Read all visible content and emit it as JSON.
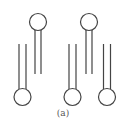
{
  "figure": {
    "caption": "(a)",
    "stroke_color": "#444444",
    "molecules": [
      {
        "name": "top-left-lipid",
        "head": {
          "cx": 38,
          "cy": 22,
          "r": 8.5
        },
        "tails": [
          {
            "x": 35,
            "y1": 30,
            "y2": 74
          },
          {
            "x": 41,
            "y1": 30,
            "y2": 74
          }
        ]
      },
      {
        "name": "top-right-lipid",
        "head": {
          "cx": 89,
          "cy": 22,
          "r": 8.5
        },
        "tails": [
          {
            "x": 86,
            "y1": 30,
            "y2": 74
          },
          {
            "x": 92,
            "y1": 30,
            "y2": 74
          }
        ]
      },
      {
        "name": "bottom-left-lipid",
        "head": {
          "cx": 22.5,
          "cy": 97,
          "r": 8.5
        },
        "tails": [
          {
            "x": 19,
            "y1": 44,
            "y2": 89
          },
          {
            "x": 26,
            "y1": 44,
            "y2": 89
          }
        ]
      },
      {
        "name": "bottom-middle-lipid",
        "head": {
          "cx": 72.5,
          "cy": 97,
          "r": 8.5
        },
        "tails": [
          {
            "x": 69,
            "y1": 44,
            "y2": 89
          },
          {
            "x": 76,
            "y1": 44,
            "y2": 89
          }
        ]
      },
      {
        "name": "bottom-right-lipid",
        "head": {
          "cx": 107,
          "cy": 97,
          "r": 8.5
        },
        "tails": [
          {
            "x": 103.5,
            "y1": 44,
            "y2": 89
          },
          {
            "x": 110.5,
            "y1": 44,
            "y2": 89
          }
        ]
      }
    ]
  }
}
